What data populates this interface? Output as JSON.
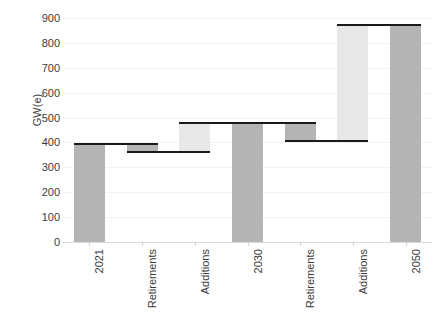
{
  "chart_data": {
    "type": "bar",
    "subtype": "waterfall",
    "title": "",
    "xlabel": "",
    "ylabel": "GW(e)",
    "ylim": [
      0,
      900
    ],
    "yticks": [
      0,
      100,
      200,
      300,
      400,
      500,
      600,
      700,
      800,
      900
    ],
    "ytick_labels": [
      "0",
      "100",
      "200",
      "300",
      "400",
      "500",
      "600",
      "700",
      "800",
      "900"
    ],
    "grid": true,
    "legend": "none",
    "categories": [
      "2021",
      "Retirements",
      "Additions",
      "2030",
      "Retirements",
      "Additions",
      "2050"
    ],
    "bars": [
      {
        "label": "2021",
        "kind": "total",
        "base": 0,
        "top": 395,
        "delta": 395,
        "value": 395,
        "color": "#b4b4b4"
      },
      {
        "label": "Retirements",
        "kind": "decrease",
        "base": 363,
        "top": 395,
        "delta": -32,
        "value": 363,
        "color": "#b4b4b4"
      },
      {
        "label": "Additions",
        "kind": "increase",
        "base": 363,
        "top": 480,
        "delta": 117,
        "value": 480,
        "color": "#e8e8e8"
      },
      {
        "label": "2030",
        "kind": "total",
        "base": 0,
        "top": 480,
        "delta": 480,
        "value": 480,
        "color": "#b4b4b4"
      },
      {
        "label": "Retirements",
        "kind": "decrease",
        "base": 405,
        "top": 480,
        "delta": -75,
        "value": 405,
        "color": "#b4b4b4"
      },
      {
        "label": "Additions",
        "kind": "increase",
        "base": 405,
        "top": 872,
        "delta": 467,
        "value": 872,
        "color": "#e8e8e8"
      },
      {
        "label": "2050",
        "kind": "total",
        "base": 0,
        "top": 872,
        "delta": 872,
        "value": 872,
        "color": "#b4b4b4"
      }
    ],
    "connectors": [
      {
        "from_index": 0,
        "to_index": 1,
        "level": 395
      },
      {
        "from_index": 1,
        "to_index": 2,
        "level": 363
      },
      {
        "from_index": 2,
        "to_index": 3,
        "level": 480
      },
      {
        "from_index": 3,
        "to_index": 4,
        "level": 480
      },
      {
        "from_index": 4,
        "to_index": 5,
        "level": 405
      },
      {
        "from_index": 5,
        "to_index": 6,
        "level": 872
      }
    ],
    "colors": {
      "total": "#b4b4b4",
      "decrease": "#b4b4b4",
      "increase": "#e8e8e8",
      "connector": "#1a1a1a",
      "gridline": "#f2f2f2",
      "axis": "#d9d9d9",
      "text": "#3b3b3b"
    }
  }
}
